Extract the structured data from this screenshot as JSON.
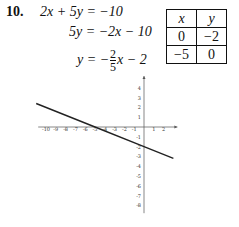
{
  "problem": {
    "number": "10.",
    "steps": {
      "line1": "2x + 5y = −10",
      "line2": "5y = −2x − 10",
      "line3_prefix": "y = −",
      "line3_num": "2",
      "line3_den": "5",
      "line3_suffix": "x − 2"
    }
  },
  "table": {
    "headers": [
      "x",
      "y"
    ],
    "rows": [
      [
        "0",
        "−2"
      ],
      [
        "−5",
        "0"
      ]
    ]
  },
  "chart_data": {
    "type": "line",
    "title": "",
    "xlabel": "",
    "ylabel": "",
    "equation": "y = -2/5 x - 2",
    "x_ticks": [
      -10,
      -9,
      -8,
      -7,
      -6,
      -5,
      -4,
      -3,
      -2,
      -1,
      1,
      2
    ],
    "y_ticks": [
      4,
      3,
      2,
      1,
      -1,
      -2,
      -3,
      -4,
      -5,
      -6,
      -7,
      -8
    ],
    "xlim": [
      -11,
      3
    ],
    "ylim": [
      -9,
      5
    ],
    "grid": false,
    "series": [
      {
        "name": "2x + 5y = -10",
        "x": [
          -11,
          -5,
          0,
          3
        ],
        "y": [
          2.4,
          0,
          -2,
          -3.2
        ]
      }
    ],
    "points": [
      {
        "x": 0,
        "y": -2
      },
      {
        "x": -5,
        "y": 0
      }
    ]
  }
}
